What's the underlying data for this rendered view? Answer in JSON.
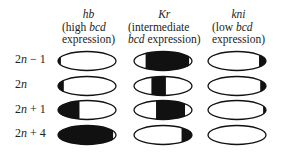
{
  "columns": [
    {
      "gene": "hb",
      "desc_pre": "(high ",
      "desc_em": "bcd",
      "desc_post": "expression)",
      "left": 62,
      "width": 52
    },
    {
      "gene": "Kr",
      "desc_pre": "(intermediate",
      "desc_em": "bcd",
      "desc_post": " expression)",
      "left": 128,
      "width": 75
    },
    {
      "gene": "kni",
      "desc_pre": "(low ",
      "desc_em": "bcd",
      "desc_post": "expression)",
      "left": 212,
      "width": 55
    }
  ],
  "rows": [
    {
      "label_pre": "2",
      "label_em": "n",
      "label_post": " − 1"
    },
    {
      "label_pre": "2",
      "label_em": "n",
      "label_post": ""
    },
    {
      "label_pre": "2",
      "label_em": "n",
      "label_post": " + 1"
    },
    {
      "label_pre": "2",
      "label_em": "n",
      "label_post": " + 4"
    }
  ],
  "fills": {
    "note": "fractions [start,end] along ellipse width that are black",
    "r0": [
      [
        [
          0,
          0.05
        ]
      ],
      [
        [
          0.2,
          0.95
        ]
      ],
      [
        [
          0.88,
          1
        ]
      ]
    ],
    "r1": [
      [
        [
          0,
          0.1
        ]
      ],
      [
        [
          0.3,
          0.55
        ]
      ],
      [
        [
          0.9,
          1
        ]
      ]
    ],
    "r2": [
      [
        [
          0,
          0.37
        ]
      ],
      [
        [
          0.38,
          0.88
        ]
      ],
      [
        [
          0.95,
          1
        ]
      ]
    ],
    "r3": [
      [
        [
          0,
          0.95
        ]
      ],
      [
        [
          0.82,
          1
        ]
      ],
      []
    ]
  }
}
